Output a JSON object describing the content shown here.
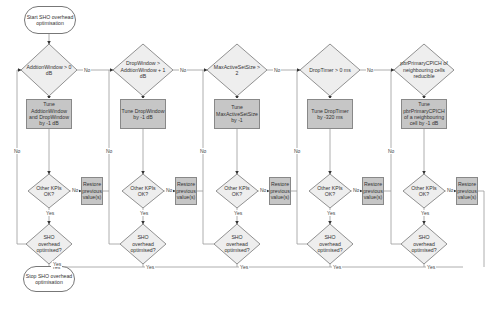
{
  "start": {
    "label": "Start SHO overhead optimisation"
  },
  "stop": {
    "label": "Stop SHO overhead optimisation"
  },
  "colors": {
    "process_fill": "#c6c6c6",
    "decision_fill": "#eeeeee",
    "line": "#888888",
    "stroke": "#777777"
  },
  "edge_labels": {
    "yes": "Yes",
    "no": "No"
  },
  "columns": [
    {
      "decision": "AddtionWindow > 0 dB",
      "tune": "Tune AddtionWindow and DropWindow by -1 dB",
      "kpi_check": "Other KPIs OK?",
      "restore": "Restore previous value(s)",
      "optimised_check": "SHO overhead optimised?"
    },
    {
      "decision": "DropWindow > AddtionWindow + 1 dB",
      "tune": "Tune DropWindow by -1 dB",
      "kpi_check": "Other KPIs OK?",
      "restore": "Restore previous value(s)",
      "optimised_check": "SHO overhead optimised?"
    },
    {
      "decision": "MaxActiveSetSize > 2",
      "tune": "Tune MaxActiveSetSize by -1",
      "kpi_check": "Other KPIs OK?",
      "restore": "Restore previous value(s)",
      "optimised_check": "SHO overhead optimised?"
    },
    {
      "decision": "DropTimer > 0 ms",
      "tune": "Tune DropTimer by -320 ms",
      "kpi_check": "Other KPIs OK?",
      "restore": "Restore previous value(s)",
      "optimised_check": "SHO overhead optimised?"
    },
    {
      "decision": "pbrPrimaryCPICH of neighbouring cells reducible",
      "tune": "Tune pbrPrimaryCPICH of a neighbouring cell by -1 dB",
      "kpi_check": "Other KPIs OK?",
      "restore": "Restore previous value(s)",
      "optimised_check": "SHO overhead optimised?"
    }
  ]
}
